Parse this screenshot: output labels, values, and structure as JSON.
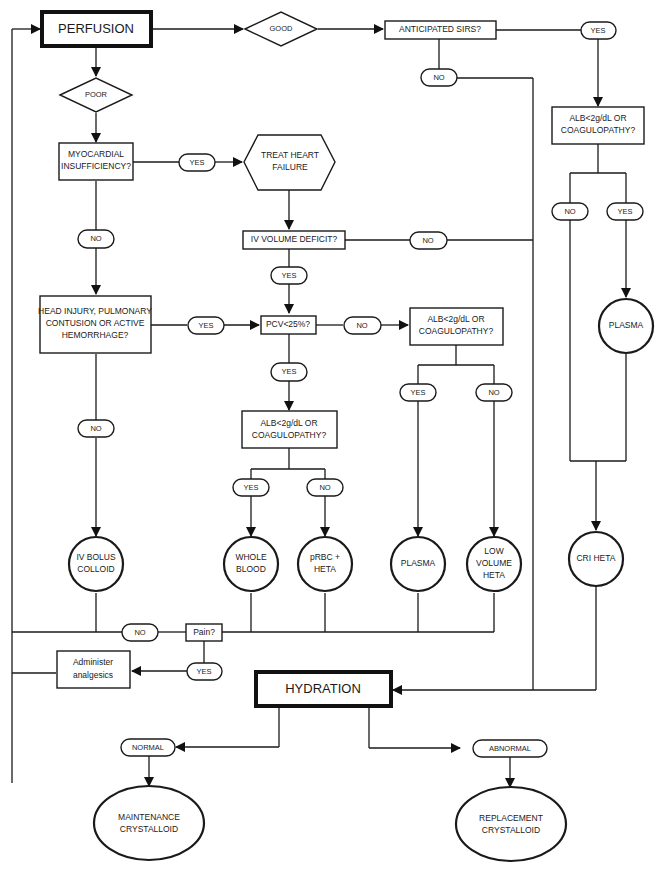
{
  "diagram": {
    "type": "flowchart",
    "line_color": "#1a1a1a",
    "background": "#ffffff",
    "nodes": {
      "perfusion": "PERFUSION",
      "good": "GOOD",
      "poor": "POOR",
      "anticipated_sirs": "ANTICIPATED SIRS?",
      "sirs_yes": "YES",
      "sirs_no": "NO",
      "right_alb_line1": "ALB<2g/dL OR",
      "right_alb_line2": "COAGULOPATHY?",
      "right_alb_no": "NO",
      "right_alb_yes": "YES",
      "right_plasma": "PLASMA",
      "cri_heta": "CRI HETA",
      "myocardial_line1": "MYOCARDIAL",
      "myocardial_line2": "INSUFFICIENCY?",
      "myocardial_yes": "YES",
      "myocardial_no": "NO",
      "treat_heart_line1": "TREAT HEART",
      "treat_heart_line2": "FAILURE",
      "iv_volume_deficit": "IV VOLUME DEFICIT?",
      "iv_volume_no": "NO",
      "iv_volume_yes": "YES",
      "head_injury_line1": "HEAD INJURY, PULMONARY",
      "head_injury_line2": "CONTUSION OR ACTIVE",
      "head_injury_line3": "HEMORRHAGE?",
      "head_injury_yes": "YES",
      "head_injury_no": "NO",
      "pcv": "PCV<25%?",
      "pcv_no": "NO",
      "pcv_yes": "YES",
      "mid_alb_line1": "ALB<2g/dL OR",
      "mid_alb_line2": "COAGULOPATHY?",
      "mid_alb_yes": "YES",
      "mid_alb_no": "NO",
      "low_alb_line1": "ALB<2g/dL  OR",
      "low_alb_line2": "COAGULOPATHY?",
      "low_alb_yes": "YES",
      "low_alb_no": "NO",
      "iv_bolus_line1": "IV BOLUS",
      "iv_bolus_line2": "COLLOID",
      "whole_blood_line1": "WHOLE",
      "whole_blood_line2": "BLOOD",
      "prbc_line1": "pRBC +",
      "prbc_line2": "HETA",
      "mid_plasma": "PLASMA",
      "low_volume_line1": "LOW",
      "low_volume_line2": "VOLUME",
      "low_volume_line3": "HETA",
      "pain": "Pain?",
      "pain_no": "NO",
      "pain_yes": "YES",
      "analgesics_line1": "Administer",
      "analgesics_line2": "analgesics",
      "hydration": "HYDRATION",
      "normal": "NORMAL",
      "abnormal": "ABNORMAL",
      "maintenance_line1": "MAINTENANCE",
      "maintenance_line2": "CRYSTALLOID",
      "replacement_line1": "REPLACEMENT",
      "replacement_line2": "CRYSTALLOID"
    }
  }
}
